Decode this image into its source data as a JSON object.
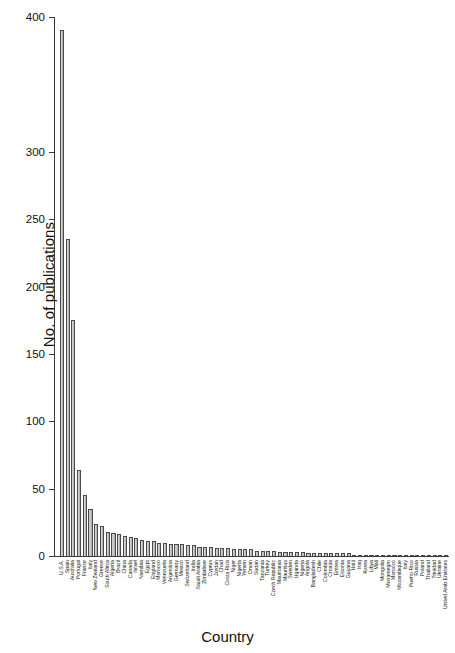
{
  "chart_data": {
    "type": "bar",
    "title": "",
    "xlabel": "Country",
    "ylabel": "No. of publications",
    "ylim": [
      0,
      400
    ],
    "yticks": [
      0,
      50,
      100,
      150,
      200,
      250,
      300,
      400
    ],
    "ytick_labels": [
      "0",
      "50",
      "100",
      "150",
      "200",
      "250",
      "300",
      "400"
    ],
    "grid": false,
    "legend": null,
    "bar_color": "#c6c6c6",
    "bar_edge_color": "#4a4a4a",
    "categories": [
      "U.S.A.",
      "Spain",
      "Australia",
      "Portugal",
      "France",
      "Italy",
      "New Zealand",
      "Greece",
      "South Africa",
      "Algeria",
      "Brazil",
      "China",
      "Canada",
      "Israel",
      "Namibia",
      "Egypt",
      "England",
      "Morocco",
      "Venezuela",
      "Argentina",
      "Germany",
      "Mexico",
      "Switzerland",
      "India",
      "Saudi Arabia",
      "Zimbabwe",
      "Cyprus",
      "Jordan",
      "Chad",
      "Costa Rica",
      "Niger",
      "Nigeria",
      "Yemen",
      "Oman",
      "Sudan",
      "Tanzania",
      "Turkey",
      "Czech Republic",
      "Mauritania",
      "Mauritius",
      "Sweden",
      "Uganda",
      "Nigeria",
      "Angola",
      "Bangladesh",
      "Chile",
      "Colombia",
      "Croatia",
      "Eritrea",
      "Estonia",
      "Guyana",
      "Haiti",
      "Iraq",
      "Korea",
      "Libya",
      "Mali",
      "Mongolia",
      "Montenegro",
      "Morocco",
      "Mozambique",
      "Italy",
      "Puerto Rico",
      "Russia",
      "Poland",
      "Thailand",
      "Trinidad",
      "Ukraine",
      "United Arab Emirates"
    ],
    "values": [
      390,
      235,
      175,
      64,
      45,
      35,
      24,
      22,
      18,
      17,
      16,
      15,
      14,
      13,
      12,
      11,
      11,
      10,
      10,
      9,
      9,
      9,
      8,
      8,
      7,
      7,
      7,
      6,
      6,
      6,
      5,
      5,
      5,
      5,
      4,
      4,
      4,
      4,
      3,
      3,
      3,
      3,
      3,
      2,
      2,
      2,
      2,
      2,
      2,
      2,
      2,
      1,
      1,
      1,
      1,
      1,
      1,
      1,
      1,
      1,
      1,
      1,
      1,
      1,
      1,
      1,
      1,
      1
    ]
  }
}
